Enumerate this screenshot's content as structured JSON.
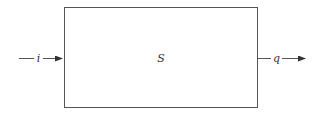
{
  "diagram": {
    "system": {
      "label": "S"
    },
    "input": {
      "label": "i"
    },
    "output": {
      "label": "q"
    },
    "colors": {
      "stroke": "#555555",
      "text": "#333333",
      "background": "#ffffff"
    }
  }
}
